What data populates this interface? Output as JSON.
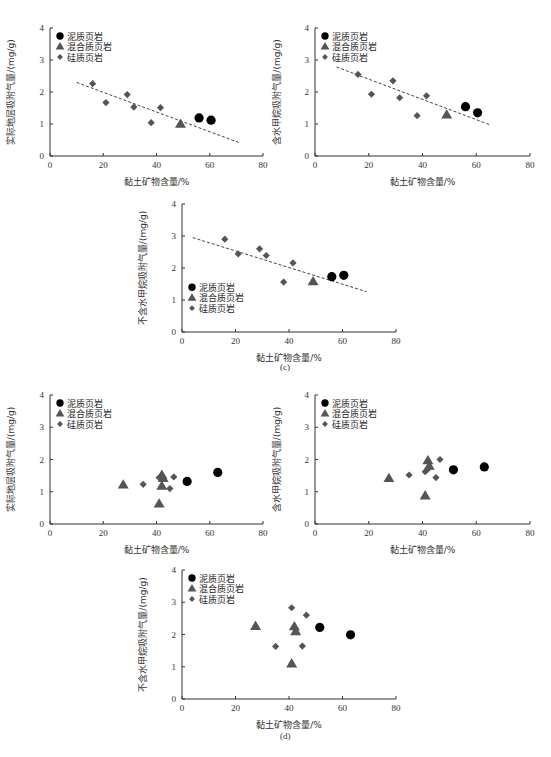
{
  "captions": {
    "c": "(c)",
    "d": "(d)"
  },
  "legend": {
    "mud": "泥质页岩",
    "mixed": "混合质页岩",
    "silic": "硅质页岩"
  },
  "colors": {
    "mud": "#000000",
    "mixed": "#555555",
    "silic": "#555555",
    "trend": "#444444",
    "axis": "#333333"
  },
  "chart_data": [
    {
      "id": "c1",
      "panel": "c",
      "type": "scatter",
      "xlabel": "黏土矿物含量/%",
      "ylabel": "实际地层吸附气量/(mg/g)",
      "xlim": [
        0,
        80
      ],
      "ylim": [
        0,
        4
      ],
      "xticks": [
        0,
        20,
        40,
        60,
        80
      ],
      "yticks": [
        0,
        1,
        2,
        3,
        4
      ],
      "legend_position": "upper-left",
      "trendline": {
        "x": [
          10,
          71
        ],
        "y": [
          2.3,
          0.42
        ],
        "style": "dashed"
      },
      "series": [
        {
          "name": "泥质页岩",
          "marker": "circle",
          "points": [
            [
              56,
              1.19
            ],
            [
              60.5,
              1.12
            ]
          ]
        },
        {
          "name": "混合质页岩",
          "marker": "triangle",
          "points": [
            [
              49,
              1.0
            ]
          ]
        },
        {
          "name": "硅质页岩",
          "marker": "diamond",
          "points": [
            [
              16,
              2.26
            ],
            [
              21,
              1.67
            ],
            [
              29,
              1.92
            ],
            [
              31.5,
              1.53
            ],
            [
              38,
              1.04
            ],
            [
              41.5,
              1.51
            ]
          ]
        }
      ]
    },
    {
      "id": "c2",
      "panel": "c",
      "type": "scatter",
      "xlabel": "黏土矿物含量/%",
      "ylabel": "含水甲烷吸附气量/(mg/g)",
      "xlim": [
        0,
        80
      ],
      "ylim": [
        0,
        4
      ],
      "xticks": [
        0,
        20,
        40,
        60,
        80
      ],
      "yticks": [
        0,
        1,
        2,
        3,
        4
      ],
      "legend_position": "upper-left",
      "trendline": {
        "x": [
          8,
          65
        ],
        "y": [
          2.78,
          0.98
        ],
        "style": "dashed"
      },
      "series": [
        {
          "name": "泥质页岩",
          "marker": "circle",
          "points": [
            [
              56,
              1.54
            ],
            [
              60.5,
              1.35
            ]
          ]
        },
        {
          "name": "混合质页岩",
          "marker": "triangle",
          "points": [
            [
              49,
              1.29
            ]
          ]
        },
        {
          "name": "硅质页岩",
          "marker": "diamond",
          "points": [
            [
              16,
              2.55
            ],
            [
              21,
              1.93
            ],
            [
              29,
              2.35
            ],
            [
              31.5,
              1.82
            ],
            [
              38,
              1.26
            ],
            [
              41.5,
              1.88
            ]
          ]
        }
      ]
    },
    {
      "id": "c3",
      "panel": "c",
      "type": "scatter",
      "xlabel": "黏土矿物含量/%",
      "ylabel": "不含水甲烷吸附气量/(mg/g)",
      "xlim": [
        0,
        80
      ],
      "ylim": [
        0,
        4
      ],
      "xticks": [
        0,
        20,
        40,
        60,
        80
      ],
      "yticks": [
        0,
        1,
        2,
        3,
        4
      ],
      "legend_position": "lower-left",
      "trendline": {
        "x": [
          4,
          69
        ],
        "y": [
          2.95,
          1.26
        ],
        "style": "dashed"
      },
      "series": [
        {
          "name": "泥质页岩",
          "marker": "circle",
          "points": [
            [
              56,
              1.73
            ],
            [
              60.5,
              1.77
            ]
          ]
        },
        {
          "name": "混合质页岩",
          "marker": "triangle",
          "points": [
            [
              49,
              1.58
            ]
          ]
        },
        {
          "name": "硅质页岩",
          "marker": "diamond",
          "points": [
            [
              16,
              2.9
            ],
            [
              21,
              2.44
            ],
            [
              29,
              2.6
            ],
            [
              31.5,
              2.39
            ],
            [
              38,
              1.56
            ],
            [
              41.5,
              2.16
            ]
          ]
        }
      ]
    },
    {
      "id": "d1",
      "panel": "d",
      "type": "scatter",
      "xlabel": "黏土矿物含量/%",
      "ylabel": "实际地层吸附气量/(mg/g)",
      "xlim": [
        0,
        80
      ],
      "ylim": [
        0,
        4
      ],
      "xticks": [
        0,
        20,
        40,
        60,
        80
      ],
      "yticks": [
        0,
        1,
        2,
        3,
        4
      ],
      "legend_position": "upper-left",
      "series": [
        {
          "name": "泥质页岩",
          "marker": "circle",
          "points": [
            [
              51.5,
              1.32
            ],
            [
              63,
              1.6
            ]
          ]
        },
        {
          "name": "混合质页岩",
          "marker": "triangle",
          "points": [
            [
              27.5,
              1.22
            ],
            [
              41,
              0.63
            ],
            [
              42,
              1.18
            ],
            [
              42,
              1.52
            ],
            [
              42.5,
              1.42
            ]
          ]
        },
        {
          "name": "硅质页岩",
          "marker": "diamond",
          "points": [
            [
              35,
              1.23
            ],
            [
              41,
              1.44
            ],
            [
              45,
              1.1
            ],
            [
              46.5,
              1.46
            ]
          ]
        }
      ]
    },
    {
      "id": "d2",
      "panel": "d",
      "type": "scatter",
      "xlabel": "黏土矿物含量/%",
      "ylabel": "含水甲烷吸附气量/(mg/g)",
      "xlim": [
        0,
        80
      ],
      "ylim": [
        0,
        4
      ],
      "xticks": [
        0,
        20,
        40,
        60,
        80
      ],
      "yticks": [
        0,
        1,
        2,
        3,
        4
      ],
      "legend_position": "upper-left",
      "series": [
        {
          "name": "泥质页岩",
          "marker": "circle",
          "points": [
            [
              51.5,
              1.68
            ],
            [
              63,
              1.77
            ]
          ]
        },
        {
          "name": "混合质页岩",
          "marker": "triangle",
          "points": [
            [
              27.5,
              1.42
            ],
            [
              41,
              0.88
            ],
            [
              42,
              1.97
            ],
            [
              42.5,
              1.8
            ]
          ]
        },
        {
          "name": "硅质页岩",
          "marker": "diamond",
          "points": [
            [
              35,
              1.52
            ],
            [
              41,
              1.62
            ],
            [
              42,
              1.7
            ],
            [
              45,
              1.44
            ],
            [
              46.5,
              2.0
            ]
          ]
        }
      ]
    },
    {
      "id": "d3",
      "panel": "d",
      "type": "scatter",
      "xlabel": "黏土矿物含量/%",
      "ylabel": "不含水甲烷吸附气量/(mg/g)",
      "xlim": [
        0,
        80
      ],
      "ylim": [
        0,
        4
      ],
      "xticks": [
        0,
        20,
        40,
        60,
        80
      ],
      "yticks": [
        0,
        1,
        2,
        3,
        4
      ],
      "legend_position": "upper-left",
      "series": [
        {
          "name": "泥质页岩",
          "marker": "circle",
          "points": [
            [
              51.5,
              2.22
            ],
            [
              63,
              1.99
            ]
          ]
        },
        {
          "name": "混合质页岩",
          "marker": "triangle",
          "points": [
            [
              27.5,
              2.26
            ],
            [
              41,
              1.1
            ],
            [
              42,
              2.25
            ],
            [
              42.5,
              2.1
            ]
          ]
        },
        {
          "name": "硅质页岩",
          "marker": "diamond",
          "points": [
            [
              35,
              1.63
            ],
            [
              41,
              2.83
            ],
            [
              45,
              1.64
            ],
            [
              46.5,
              2.6
            ]
          ]
        }
      ]
    }
  ]
}
